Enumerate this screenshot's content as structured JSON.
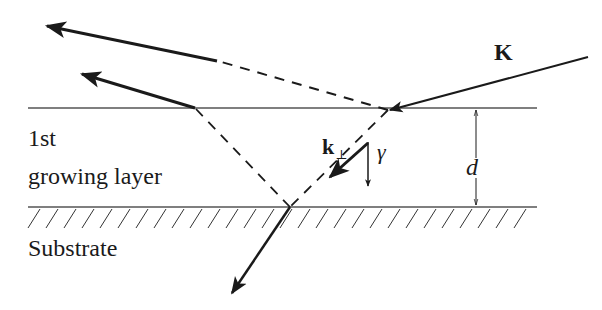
{
  "diagram": {
    "labels": {
      "incident_wavevector": "K",
      "perp_wavevector": "k",
      "perp_subscript": "⊥",
      "angle": "γ",
      "thickness": "d",
      "layer_line1": "1st",
      "layer_line2": "growing layer",
      "substrate": "Substrate"
    },
    "colors": {
      "stroke": "#1a1a1a",
      "thin_line": "#555555",
      "background": "#ffffff"
    },
    "geometry": {
      "surface_y": 108,
      "interface_y": 207,
      "line_x_start": 28,
      "line_x_end": 537
    }
  }
}
